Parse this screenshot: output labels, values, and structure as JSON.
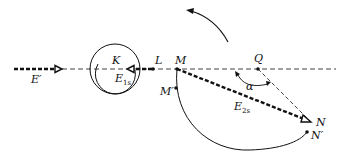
{
  "colors": {
    "ink": "#111111",
    "background": "#ffffff"
  },
  "labels": {
    "E_prime": "E′",
    "K": "K",
    "E1s_main": "E",
    "E1s_sub": "1s",
    "L": "L",
    "M": "M",
    "M_prime": "M′",
    "Q": "Q",
    "alpha": "α",
    "E2s_main": "E",
    "E2s_sub": "2s",
    "N": "N",
    "N_prime": "N′"
  },
  "points": {
    "L": [
      153,
      69
    ],
    "M": [
      177,
      69
    ],
    "M_prime": [
      176,
      88
    ],
    "Q": [
      258,
      69
    ],
    "N": [
      311,
      122
    ],
    "N_prime": [
      307,
      132
    ]
  }
}
